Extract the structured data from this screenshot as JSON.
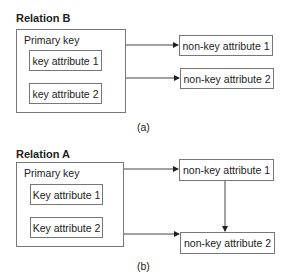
{
  "diagram_a": {
    "title": "Relation B",
    "primary_key_label": "Primary key",
    "key_attributes": [
      "key attribute 1",
      "key attribute 2"
    ],
    "non_key_attributes": [
      "non-key attribute 1",
      "non-key attribute 2"
    ],
    "caption": "(a)",
    "dependencies": [
      {
        "from": "Primary key",
        "to": "non-key attribute 1"
      },
      {
        "from": "Primary key",
        "to": "non-key attribute 2"
      }
    ]
  },
  "diagram_b": {
    "title": "Relation A",
    "primary_key_label": "Primary key",
    "key_attributes": [
      "Key attribute 1",
      "Key attribute 2"
    ],
    "non_key_attributes": [
      "non-key attribute 1",
      "non-key attribute 2"
    ],
    "caption": "(b)",
    "dependencies": [
      {
        "from": "Primary key",
        "to": "non-key attribute 1"
      },
      {
        "from": "Primary key",
        "to": "non-key attribute 2"
      },
      {
        "from": "non-key attribute 1",
        "to": "non-key attribute 2"
      }
    ]
  },
  "colors": {
    "line": "#333333",
    "box_border": "#777777",
    "text": "#222222"
  }
}
